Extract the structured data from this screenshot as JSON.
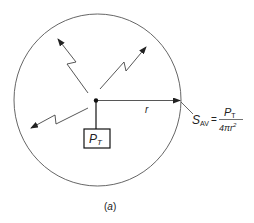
{
  "figure": {
    "caption": "(a)",
    "source_label": "P",
    "source_label_sub": "T",
    "radius_label": "r",
    "formula": {
      "lhs_main": "S",
      "lhs_sub": "AV",
      "equals": "=",
      "numerator_main": "P",
      "numerator_sub": "T",
      "denominator_main": "4πr",
      "denominator_sup": "2"
    }
  },
  "colors": {
    "stroke": "#333333",
    "circle": "#555555",
    "background": "#ffffff"
  }
}
